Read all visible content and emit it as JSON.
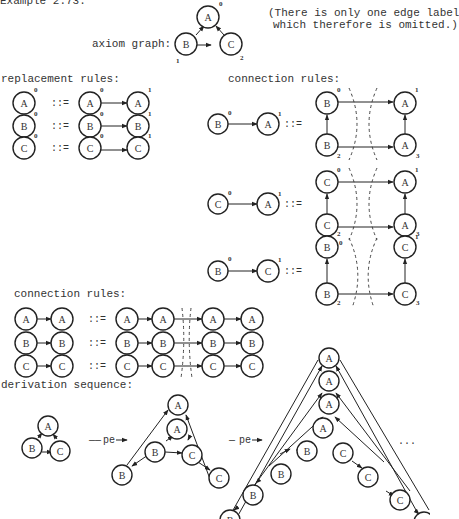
{
  "title": "Example 2.73.",
  "axiom": {
    "label": "axiom graph:",
    "note_line1": "(There is only one edge label",
    "note_line2": "which therefore is omitted.)",
    "nodes": [
      {
        "label": "A",
        "index": "0"
      },
      {
        "label": "B",
        "index": "1"
      },
      {
        "label": "C",
        "index": "2"
      }
    ]
  },
  "replacement_rules": {
    "heading": "replacement rules:",
    "operator": "::=",
    "rules": [
      {
        "lhs": "A",
        "lhs_index": "0",
        "rhs": [
          "A",
          "A"
        ],
        "rhs_index": [
          "0",
          "1"
        ]
      },
      {
        "lhs": "B",
        "lhs_index": "0",
        "rhs": [
          "B",
          "B"
        ],
        "rhs_index": [
          "0",
          "1"
        ]
      },
      {
        "lhs": "C",
        "lhs_index": "0",
        "rhs": [
          "C",
          "C"
        ],
        "rhs_index": [
          "0",
          "1"
        ]
      }
    ]
  },
  "connection_rules_1": {
    "heading": "connection rules:",
    "operator": "::=",
    "rules": [
      {
        "lhs": [
          "B",
          "A"
        ],
        "lhs_index": [
          "0",
          "1"
        ],
        "rhs": [
          "B",
          "A",
          "B",
          "A"
        ],
        "rhs_index": [
          "0",
          "1",
          "2",
          "3"
        ]
      },
      {
        "lhs": [
          "C",
          "A"
        ],
        "lhs_index": [
          "0",
          "1"
        ],
        "rhs": [
          "C",
          "A",
          "C",
          "A"
        ],
        "rhs_index": [
          "0",
          "1",
          "2",
          "3"
        ]
      },
      {
        "lhs": [
          "B",
          "C"
        ],
        "lhs_index": [
          "0",
          "1"
        ],
        "rhs": [
          "B",
          "C",
          "B",
          "C"
        ],
        "rhs_index": [
          "0",
          "1",
          "2",
          "3"
        ]
      }
    ]
  },
  "connection_rules_2": {
    "heading": "connection rules:",
    "operator": "::=",
    "rules": [
      {
        "lhs": [
          "A",
          "A"
        ],
        "rhs": [
          "A",
          "A",
          "A",
          "A"
        ]
      },
      {
        "lhs": [
          "B",
          "B"
        ],
        "rhs": [
          "B",
          "B",
          "B",
          "B"
        ]
      },
      {
        "lhs": [
          "C",
          "C"
        ],
        "rhs": [
          "C",
          "C",
          "C",
          "C"
        ]
      }
    ]
  },
  "derivation": {
    "heading": "derivation sequence:",
    "step_label": "pe",
    "ellipsis": "..."
  }
}
